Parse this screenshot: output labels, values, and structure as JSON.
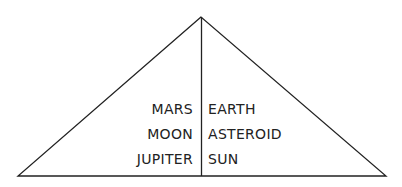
{
  "diagram": {
    "shape": "triangle",
    "stroke_color": "#222222",
    "text_color": "#222222",
    "left_column": [
      "MARS",
      "MOON",
      "JUPITER"
    ],
    "right_column": [
      "EARTH",
      "ASTEROID",
      "SUN"
    ]
  }
}
